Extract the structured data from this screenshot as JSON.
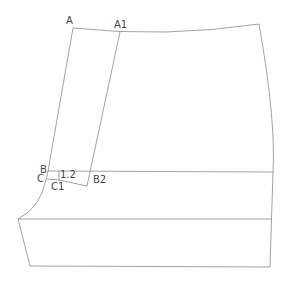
{
  "diagram": {
    "type": "sewing-pattern-draft",
    "line_color": "#8a8a8a",
    "label_color": "#444444",
    "labels": {
      "A": "A",
      "A1": "A1",
      "B": "B",
      "B2": "B2",
      "C": "C",
      "C1": "C1",
      "measure": "1.2"
    }
  }
}
